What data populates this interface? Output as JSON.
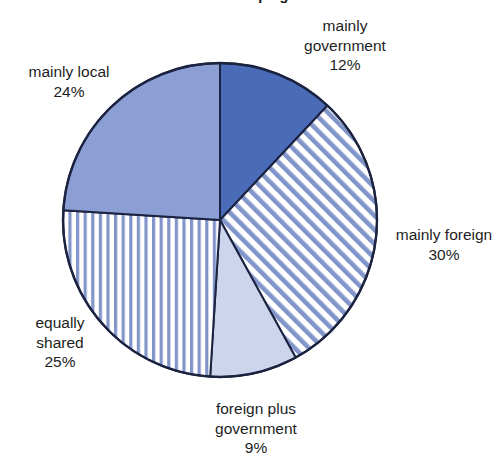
{
  "chart_data": {
    "type": "pie",
    "title": "in the developing world",
    "title_cropped": true,
    "xlabel": "",
    "ylabel": "",
    "grid": false,
    "legend_position": "none",
    "start_angle_deg": 0,
    "direction": "clockwise",
    "categories": [
      "mainly government",
      "mainly foreign",
      "foreign plus government",
      "equally shared",
      "mainly local"
    ],
    "values": [
      12,
      30,
      9,
      25,
      24
    ],
    "value_suffix": "%",
    "slices": [
      {
        "name": "mainly government",
        "label_lines": [
          "mainly",
          "government"
        ],
        "value": 12,
        "value_text": "12%",
        "fill_style": "solid",
        "color": "#4a6cb8",
        "start_deg": 0,
        "end_deg": 43.2
      },
      {
        "name": "mainly foreign",
        "label_lines": [
          "mainly foreign"
        ],
        "value": 30,
        "value_text": "30%",
        "fill_style": "diagonal-stripes",
        "color": "#6f86c4",
        "background": "#ffffff",
        "start_deg": 43.2,
        "end_deg": 151.2
      },
      {
        "name": "foreign plus government",
        "label_lines": [
          "foreign plus",
          "government"
        ],
        "value": 9,
        "value_text": "9%",
        "fill_style": "solid",
        "color": "#ccd5ec",
        "start_deg": 151.2,
        "end_deg": 183.6
      },
      {
        "name": "equally shared",
        "label_lines": [
          "equally",
          "shared"
        ],
        "value": 25,
        "value_text": "25%",
        "fill_style": "vertical-stripes",
        "color": "#6f86c4",
        "background": "#ffffff",
        "start_deg": 183.6,
        "end_deg": 273.6
      },
      {
        "name": "mainly local",
        "label_lines": [
          "mainly local"
        ],
        "value": 24,
        "value_text": "24%",
        "fill_style": "solid",
        "color": "#8b9fd4",
        "start_deg": 273.6,
        "end_deg": 360
      }
    ],
    "outline_color": "#1b2340",
    "geometry": {
      "cx": 220,
      "cy": 220,
      "r": 157
    }
  },
  "labels": {
    "mainly_government": {
      "line1": "mainly",
      "line2": "government",
      "value": "12%"
    },
    "mainly_foreign": {
      "line1": "mainly foreign",
      "value": "30%"
    },
    "foreign_plus_government": {
      "line1": "foreign plus",
      "line2": "government",
      "value": "9%"
    },
    "equally_shared": {
      "line1": "equally",
      "line2": "shared",
      "value": "25%"
    },
    "mainly_local": {
      "line1": "mainly local",
      "value": "24%"
    }
  }
}
